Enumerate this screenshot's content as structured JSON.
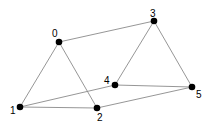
{
  "graph": {
    "nodes": [
      {
        "id": "0",
        "x": 59,
        "y": 42,
        "label_x": 52,
        "label_y": 37
      },
      {
        "id": "1",
        "x": 20,
        "y": 107,
        "label_x": 10,
        "label_y": 114
      },
      {
        "id": "2",
        "x": 97,
        "y": 108,
        "label_x": 97,
        "label_y": 121
      },
      {
        "id": "3",
        "x": 154,
        "y": 21,
        "label_x": 150,
        "label_y": 17
      },
      {
        "id": "4",
        "x": 115,
        "y": 85,
        "label_x": 104,
        "label_y": 84
      },
      {
        "id": "5",
        "x": 192,
        "y": 87,
        "label_x": 196,
        "label_y": 98
      }
    ],
    "edges": [
      [
        "0",
        "3"
      ],
      [
        "0",
        "1"
      ],
      [
        "0",
        "2"
      ],
      [
        "1",
        "2"
      ],
      [
        "1",
        "4"
      ],
      [
        "2",
        "5"
      ],
      [
        "3",
        "4"
      ],
      [
        "3",
        "5"
      ],
      [
        "4",
        "5"
      ]
    ],
    "edge_color": "#8a8a8a",
    "node_color": "#000000"
  }
}
